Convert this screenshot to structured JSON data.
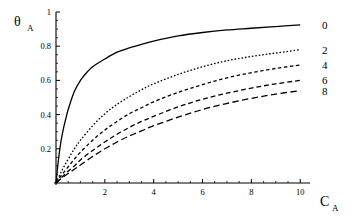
{
  "chart_data": {
    "type": "line",
    "title": "",
    "xlabel": "C_A",
    "ylabel": "θ_A",
    "xlabel_main": "C",
    "xlabel_sub": "A",
    "ylabel_main": "θ",
    "ylabel_sub": "A",
    "xlim": [
      0,
      10.4
    ],
    "ylim": [
      0,
      1.0
    ],
    "grid": false,
    "legend_position": "right-of-curve-ends",
    "xticks": [
      2,
      4,
      6,
      8,
      10
    ],
    "xtick_labels": [
      "2",
      "4",
      "6",
      "8",
      "10"
    ],
    "xminorticks": [
      0.5,
      1,
      1.5,
      2.5,
      3,
      3.5,
      4.5,
      5,
      5.5,
      6.5,
      7,
      7.5,
      8.5,
      9,
      9.5
    ],
    "yticks": [
      0.2,
      0.4,
      0.6,
      0.8,
      1
    ],
    "ytick_labels": [
      "0.2",
      "0.4",
      "0.6",
      "0.8",
      "1"
    ],
    "yminorticks": [
      0.05,
      0.1,
      0.15,
      0.25,
      0.3,
      0.35,
      0.45,
      0.5,
      0.55,
      0.65,
      0.7,
      0.75,
      0.85,
      0.9,
      0.95
    ],
    "series": [
      {
        "name": "0",
        "label": "0",
        "dash": "solid",
        "stroke_width": 1.3,
        "x": [
          0,
          0.1,
          0.2,
          0.3,
          0.4,
          0.5,
          0.75,
          1,
          1.25,
          1.5,
          2,
          2.5,
          3,
          3.5,
          4,
          5,
          6,
          7,
          8,
          9,
          10
        ],
        "y": [
          0,
          0.135,
          0.24,
          0.315,
          0.375,
          0.43,
          0.535,
          0.6,
          0.645,
          0.68,
          0.725,
          0.765,
          0.79,
          0.81,
          0.83,
          0.86,
          0.88,
          0.895,
          0.905,
          0.915,
          0.925
        ]
      },
      {
        "name": "2",
        "label": "2",
        "dash": "dotted",
        "stroke_width": 1.3,
        "x": [
          0,
          0.25,
          0.5,
          0.75,
          1,
          1.5,
          2,
          2.5,
          3,
          3.5,
          4,
          5,
          6,
          7,
          8,
          9,
          10
        ],
        "y": [
          0,
          0.075,
          0.14,
          0.2,
          0.25,
          0.335,
          0.405,
          0.46,
          0.505,
          0.545,
          0.58,
          0.635,
          0.68,
          0.715,
          0.74,
          0.76,
          0.78
        ]
      },
      {
        "name": "4",
        "label": "4",
        "dash": "short-dash",
        "stroke_width": 1.3,
        "x": [
          0,
          0.25,
          0.5,
          0.75,
          1,
          1.5,
          2,
          2.5,
          3,
          3.5,
          4,
          5,
          6,
          7,
          8,
          9,
          10
        ],
        "y": [
          0,
          0.05,
          0.095,
          0.14,
          0.18,
          0.25,
          0.31,
          0.36,
          0.405,
          0.44,
          0.475,
          0.53,
          0.575,
          0.615,
          0.645,
          0.67,
          0.69
        ]
      },
      {
        "name": "6",
        "label": "6",
        "dash": "medium-dash",
        "stroke_width": 1.3,
        "x": [
          0,
          0.25,
          0.5,
          0.75,
          1,
          1.5,
          2,
          2.5,
          3,
          3.5,
          4,
          5,
          6,
          7,
          8,
          9,
          10
        ],
        "y": [
          0,
          0.035,
          0.07,
          0.1,
          0.135,
          0.19,
          0.24,
          0.285,
          0.325,
          0.36,
          0.39,
          0.445,
          0.49,
          0.525,
          0.555,
          0.58,
          0.6
        ]
      },
      {
        "name": "8",
        "label": "8",
        "dash": "long-dash",
        "stroke_width": 1.3,
        "x": [
          0,
          0.25,
          0.5,
          0.75,
          1,
          1.5,
          2,
          2.5,
          3,
          3.5,
          4,
          5,
          6,
          7,
          8,
          9,
          10
        ],
        "y": [
          0,
          0.03,
          0.055,
          0.08,
          0.105,
          0.155,
          0.2,
          0.24,
          0.275,
          0.305,
          0.335,
          0.385,
          0.43,
          0.465,
          0.495,
          0.52,
          0.54
        ]
      }
    ],
    "end_labels": [
      {
        "text": "0",
        "value": 0.925
      },
      {
        "text": "2",
        "value": 0.78
      },
      {
        "text": "4",
        "value": 0.69
      },
      {
        "text": "6",
        "value": 0.6
      },
      {
        "text": "8",
        "value": 0.54
      }
    ],
    "colors": {
      "axis": "#000000",
      "curve": "#000000",
      "background": "#ffffff"
    }
  }
}
